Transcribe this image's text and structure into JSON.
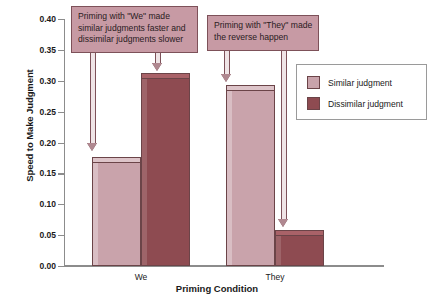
{
  "chart_data": {
    "type": "bar",
    "title": "",
    "xlabel": "Priming Condition",
    "ylabel": "Speed to Make Judgment",
    "categories": [
      "We",
      "They"
    ],
    "series": [
      {
        "name": "Similar judgment",
        "values": [
          0.177,
          0.293
        ]
      },
      {
        "name": "Dissimilar judgment",
        "values": [
          0.312,
          0.058
        ]
      }
    ],
    "ylim": [
      0.0,
      0.4
    ],
    "ytick_labels": [
      "0.00",
      "0.05",
      "0.10",
      "0.15",
      "0.20",
      "0.25",
      "0.30",
      "0.35",
      "0.40"
    ],
    "ytick_values": [
      0.0,
      0.05,
      0.1,
      0.15,
      0.2,
      0.25,
      0.3,
      0.35,
      0.4
    ],
    "grid": false,
    "legend_position": "upper right",
    "colors": {
      "similar": "#c9a3ab",
      "dissimilar": "#8e4b51",
      "bar_outline": "#6b4448",
      "axis": "#8c8c8c",
      "callout_fill": "#c79aa4",
      "callout_border": "#7d5159"
    },
    "annotations": [
      {
        "id": "callout-we",
        "lines": [
          "Priming with \"We\" made",
          "similar judgments faster and",
          "dissimilar judgments slower"
        ],
        "points_to": [
          "We / Similar judgment",
          "We / Dissimilar judgment"
        ]
      },
      {
        "id": "callout-they",
        "lines": [
          "Priming with \"They\" made",
          "the reverse happen"
        ],
        "points_to": [
          "They / Similar judgment",
          "They / Dissimilar judgment"
        ]
      }
    ]
  },
  "legend": {
    "items": [
      {
        "label": "Similar judgment",
        "key": "similar"
      },
      {
        "label": "Dissimilar judgment",
        "key": "dissimilar"
      }
    ]
  }
}
